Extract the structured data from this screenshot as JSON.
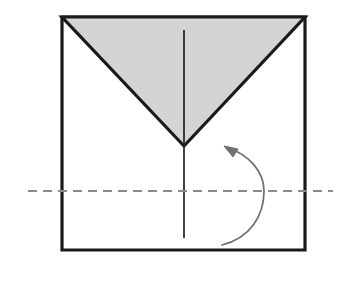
{
  "figure": {
    "canvas": {
      "width": 348,
      "height": 286,
      "background": "#ffffff"
    }
  },
  "colors": {
    "paper_fill": "#ffffff",
    "flap_fill": "#d4d4d4",
    "outline": "#1a1a1a",
    "crease_line": "#2b2b2b",
    "fold_line": "#8a8a8a",
    "arrow": "#6e6e73"
  },
  "shapes": {
    "sheet": {
      "name": "square-sheet",
      "points": "62,17 305,17 305,250 62,250",
      "stroke_width": 3.2
    },
    "folded_flap": {
      "name": "folded-triangle-flap",
      "points": "62,17 305,17 184,146",
      "stroke_width": 3.2,
      "shade": "shaded"
    },
    "crease_upper": {
      "name": "upper-center-crease",
      "x1": 184,
      "y1": 30,
      "x2": 184,
      "y2": 146,
      "stroke_width": 1.8
    },
    "crease_lower": {
      "name": "lower-center-crease",
      "x1": 184,
      "y1": 146,
      "x2": 184,
      "y2": 238,
      "stroke_width": 1.8
    },
    "fold_line": {
      "name": "horizontal-fold-line",
      "x1": 28,
      "y1": 191,
      "x2": 333,
      "y2": 191,
      "stroke_width": 1.8,
      "dash": "9 6",
      "style": "dashed"
    },
    "fold_arrow": {
      "name": "fold-up-arrow",
      "path": "M 222 245 C 250 238 264 216 264 191 C 264 172 250 155 226 147",
      "stroke_width": 1.7,
      "head_points": "224,146 238,149 233,157",
      "direction": "counterclockwise-up"
    }
  }
}
